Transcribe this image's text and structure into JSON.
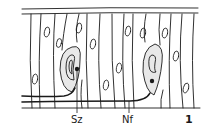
{
  "figure": {
    "number": "1",
    "labels": {
      "sensory_cell": "Sz",
      "nerve_fiber": "Nf"
    },
    "colors": {
      "ink": "#1a1a1a",
      "cell_fill": "#e8e8e8",
      "background": "#ffffff"
    },
    "structures": {
      "epithelial_cell_boundaries": 16,
      "epithelial_nuclei": 12,
      "sensory_cells": 2,
      "nerve_fibers": 2
    }
  }
}
